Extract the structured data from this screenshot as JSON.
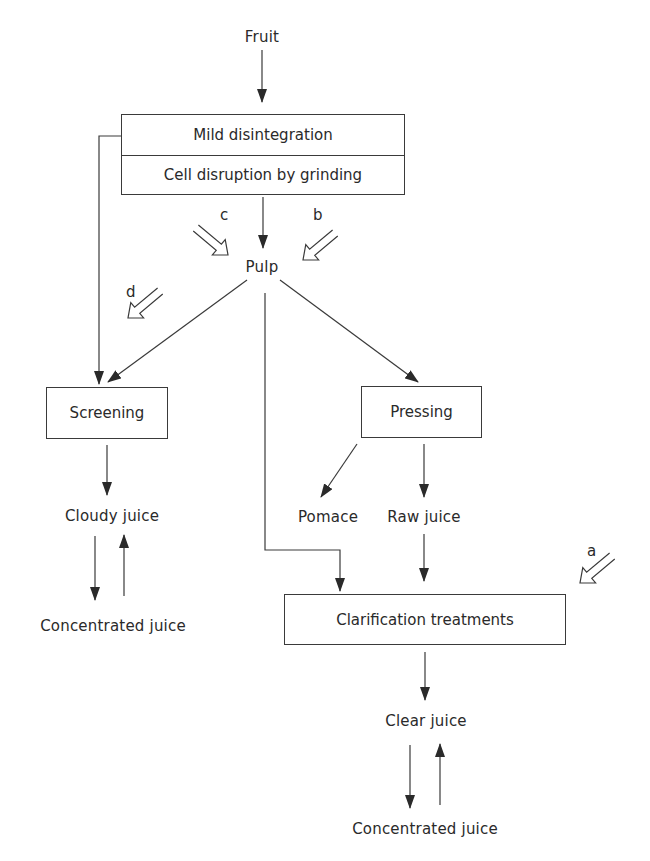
{
  "diagram": {
    "nodes": {
      "fruit": "Fruit",
      "mild_disintegration": "Mild disintegration",
      "cell_disruption": "Cell disruption by grinding",
      "pulp": "Pulp",
      "screening": "Screening",
      "pressing": "Pressing",
      "cloudy_juice": "Cloudy juice",
      "concentrated_juice_left": "Concentrated juice",
      "pomace": "Pomace",
      "raw_juice": "Raw juice",
      "clarification": "Clarification treatments",
      "clear_juice": "Clear juice",
      "concentrated_juice_right": "Concentrated juice"
    },
    "enzyme_markers": {
      "a": "a",
      "b": "b",
      "c": "c",
      "d": "d"
    },
    "edges": [
      {
        "from": "Fruit",
        "to": "Mild disintegration / Cell disruption by grinding"
      },
      {
        "from": "Mild disintegration",
        "to": "Screening"
      },
      {
        "from": "Cell disruption by grinding",
        "to": "Pulp"
      },
      {
        "from": "Pulp",
        "to": "Screening"
      },
      {
        "from": "Pulp",
        "to": "Pressing"
      },
      {
        "from": "Pulp",
        "to": "Clarification treatments"
      },
      {
        "from": "Screening",
        "to": "Cloudy juice"
      },
      {
        "from": "Cloudy juice",
        "to": "Concentrated juice",
        "bidirectional": true
      },
      {
        "from": "Pressing",
        "to": "Pomace"
      },
      {
        "from": "Pressing",
        "to": "Raw juice"
      },
      {
        "from": "Raw juice",
        "to": "Clarification treatments"
      },
      {
        "from": "Clarification treatments",
        "to": "Clear juice"
      },
      {
        "from": "Clear juice",
        "to": "Concentrated juice",
        "bidirectional": true
      }
    ],
    "colors": {
      "ink": "#2a2a2a",
      "background": "#ffffff"
    }
  }
}
